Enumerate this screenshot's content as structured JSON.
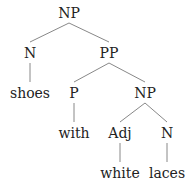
{
  "tree": {
    "nodes": [
      {
        "id": "np1",
        "label": "NP",
        "x": 69,
        "y": 13
      },
      {
        "id": "n1",
        "label": "N",
        "x": 30,
        "y": 53
      },
      {
        "id": "pp",
        "label": "PP",
        "x": 109,
        "y": 53
      },
      {
        "id": "shoes",
        "label": "shoes",
        "x": 30,
        "y": 93
      },
      {
        "id": "p",
        "label": "P",
        "x": 74,
        "y": 93
      },
      {
        "id": "np2",
        "label": "NP",
        "x": 145,
        "y": 93
      },
      {
        "id": "with",
        "label": "with",
        "x": 74,
        "y": 133
      },
      {
        "id": "adj",
        "label": "Adj",
        "x": 120,
        "y": 133
      },
      {
        "id": "n2",
        "label": "N",
        "x": 167,
        "y": 133
      },
      {
        "id": "white",
        "label": "white",
        "x": 120,
        "y": 173
      },
      {
        "id": "laces",
        "label": "laces",
        "x": 167,
        "y": 173
      }
    ],
    "edges": [
      [
        "np1",
        "n1"
      ],
      [
        "np1",
        "pp"
      ],
      [
        "n1",
        "shoes"
      ],
      [
        "pp",
        "p"
      ],
      [
        "pp",
        "np2"
      ],
      [
        "p",
        "with"
      ],
      [
        "np2",
        "adj"
      ],
      [
        "np2",
        "n2"
      ],
      [
        "adj",
        "white"
      ],
      [
        "n2",
        "laces"
      ]
    ]
  }
}
